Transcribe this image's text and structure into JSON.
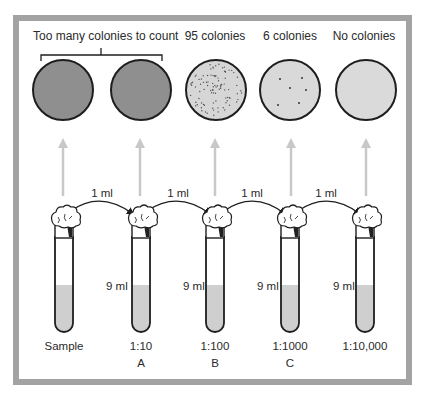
{
  "figure": {
    "plates": [
      {
        "id": "plate-sample",
        "result": "Too many colonies to count",
        "dot_count": 0,
        "fill": "#8f8f8f"
      },
      {
        "id": "plate-a",
        "result": "Too many colonies to count",
        "dot_count": 0,
        "fill": "#8f8f8f"
      },
      {
        "id": "plate-b",
        "label": "95 colonies",
        "dot_count": 95,
        "fill": "#d6d6d6"
      },
      {
        "id": "plate-c",
        "label": "6 colonies",
        "dot_count": 6,
        "fill": "#d9d9d9"
      },
      {
        "id": "plate-d",
        "label": "No colonies",
        "dot_count": 0,
        "fill": "#dadada"
      }
    ],
    "bracket_label": "Too many colonies to count",
    "transfers": [
      {
        "label": "1 ml"
      },
      {
        "label": "1 ml"
      },
      {
        "label": "1 ml"
      },
      {
        "label": "1 ml"
      }
    ],
    "tubes": [
      {
        "volume": "",
        "dilution": "Sample",
        "letter": ""
      },
      {
        "volume": "9 ml",
        "dilution": "1:10",
        "letter": "A"
      },
      {
        "volume": "9 ml",
        "dilution": "1:100",
        "letter": "B"
      },
      {
        "volume": "9 ml",
        "dilution": "1:1000",
        "letter": "C"
      },
      {
        "volume": "9 ml",
        "dilution": "1:10,000",
        "letter": ""
      }
    ],
    "colors": {
      "frame": "#a3a3a3",
      "outline": "#1e1e1e",
      "liquid": "#cfcfcf",
      "up_arrow": "#c8c8c8",
      "dense_plate": "#8f8f8f",
      "light_plate": "#d8d8d8"
    }
  }
}
